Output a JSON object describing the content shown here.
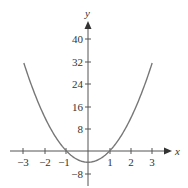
{
  "chart_data": {
    "type": "line",
    "title": "",
    "xlabel": "x",
    "ylabel": "y",
    "function": "y = 4x^2 - 4",
    "x": [
      -3,
      -2.5,
      -2,
      -1.5,
      -1,
      -0.5,
      0,
      0.5,
      1,
      1.5,
      2,
      2.5,
      3
    ],
    "series": [
      {
        "name": "parabola",
        "values": [
          32,
          21,
          12,
          5,
          0,
          -3,
          -4,
          -3,
          0,
          5,
          12,
          21,
          32
        ]
      }
    ],
    "xlim": [
      -3.4,
      3.6
    ],
    "ylim": [
      -10,
      46
    ],
    "x_ticks": [
      "-3",
      "-2",
      "-1",
      "1",
      "2",
      "3"
    ],
    "y_ticks": [
      "40",
      "32",
      "24",
      "16",
      "8",
      "-8"
    ],
    "grid": false,
    "legend": "none",
    "line_color": "#777777"
  },
  "labels": {
    "x_axis": "x",
    "y_axis": "y",
    "xt": {
      "m3": "−3",
      "m2": "−2",
      "m1": "−1",
      "p1": "1",
      "p2": "2",
      "p3": "3"
    },
    "yt": {
      "p40": "40",
      "p32": "32",
      "p24": "24",
      "p16": "16",
      "p8": "8",
      "m8": "−8"
    }
  }
}
